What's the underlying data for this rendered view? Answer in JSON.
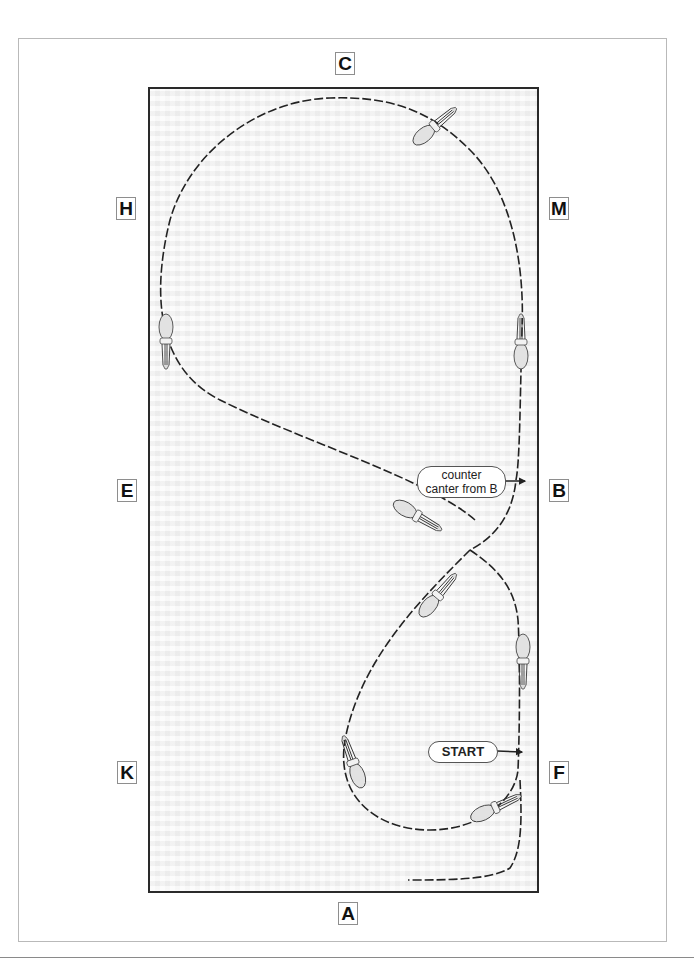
{
  "diagram": {
    "arena_markers": {
      "top": "C",
      "bottom": "A",
      "left": [
        "H",
        "E",
        "K"
      ],
      "right": [
        "M",
        "B",
        "F"
      ]
    },
    "callouts": {
      "counter_canter": "counter canter from B",
      "counter_canter_line1": "counter",
      "counter_canter_line2": "canter from B",
      "start": "START"
    },
    "horses": [
      {
        "name": "horse-top",
        "heading": "upper-left"
      },
      {
        "name": "horse-left",
        "heading": "down"
      },
      {
        "name": "horse-right-upper",
        "heading": "up"
      },
      {
        "name": "horse-center-upper",
        "heading": "right-down"
      },
      {
        "name": "horse-center-lower",
        "heading": "upper-right"
      },
      {
        "name": "horse-right-lower",
        "heading": "down"
      },
      {
        "name": "horse-bottom-left",
        "heading": "up"
      },
      {
        "name": "horse-bottom",
        "heading": "left"
      }
    ],
    "colors": {
      "track": "#222222",
      "arena_border": "#2a2a2a",
      "horse_fill": "#e2e2e2"
    }
  }
}
